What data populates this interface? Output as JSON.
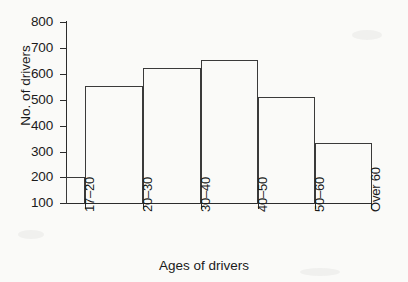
{
  "chart_data": {
    "type": "bar",
    "title": "",
    "subtitle": "",
    "xlabel": "Ages of drivers",
    "ylabel": "No. of drivers",
    "categories": [
      "17–20",
      "20–30",
      "30–40",
      "40–50",
      "50–60",
      "Over 60"
    ],
    "values": [
      200,
      550,
      620,
      650,
      510,
      330
    ],
    "series": [
      {
        "name": "No. of drivers",
        "values": [
          200,
          550,
          620,
          650,
          510,
          330
        ]
      }
    ],
    "ylim": [
      100,
      800
    ],
    "ytick_labels": [
      "800",
      "700",
      "600",
      "500",
      "400",
      "300",
      "200",
      "100"
    ],
    "ytick_values": [
      800,
      700,
      600,
      500,
      400,
      300,
      200,
      100
    ],
    "grid": false,
    "legend": false,
    "legend_position": "none",
    "bar_widths": [
      1,
      1,
      1,
      1,
      1,
      1
    ],
    "annotations": [],
    "colors": {
      "bar_outline": "#3a3a3a",
      "bar_fill": "transparent",
      "axis": "#2c2c2c",
      "text": "#1b1b1b",
      "background": "#fafaf8"
    }
  },
  "axes": {
    "y_title": "No. of drivers",
    "x_title": "Ages of drivers"
  }
}
